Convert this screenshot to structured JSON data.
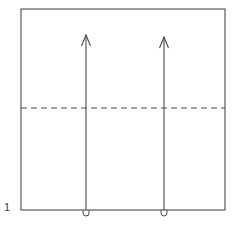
{
  "figure": {
    "domain": "diagram",
    "background_color": "#ffffff",
    "stroke_color": "#4a4a4a",
    "label_color": "#3a3a3a",
    "canvas": {
      "width": 234,
      "height": 226
    }
  },
  "labels": {
    "figure_number": "1"
  },
  "geometry": {
    "box": {
      "name": "outer-rectangle",
      "x": 21,
      "y": 9,
      "width": 204,
      "height": 201,
      "stroke_width": 1.1,
      "fill": "none"
    },
    "dashed_line": {
      "name": "horizontal-dashed-line",
      "x1": 21,
      "x2": 225,
      "y": 108,
      "stroke_width": 1.1,
      "dash_length": 6,
      "gap_length": 4
    },
    "arrows": [
      {
        "name": "left-arrow",
        "x": 86,
        "tip_y": 35,
        "base_y": 210,
        "stroke_width": 1.1,
        "head_half_width": 4.5,
        "head_height": 11,
        "loop_radius": 3.0,
        "loop_depth": 6
      },
      {
        "name": "right-arrow",
        "x": 164,
        "tip_y": 37,
        "base_y": 210,
        "stroke_width": 1.1,
        "head_half_width": 4.5,
        "head_height": 11,
        "loop_radius": 3.0,
        "loop_depth": 6
      }
    ],
    "figure_label_position": {
      "x": 4,
      "y": 211
    }
  }
}
